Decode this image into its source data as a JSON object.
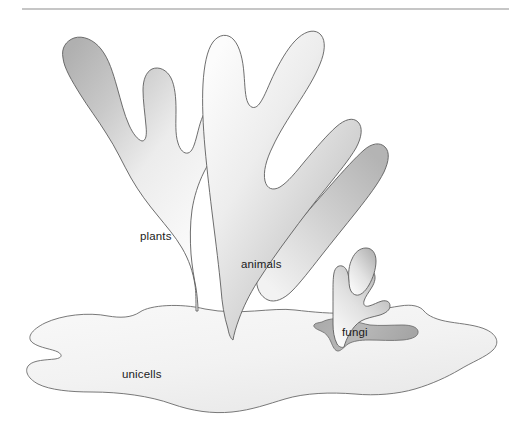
{
  "figure": {
    "background_color": "#ffffff",
    "width": 523,
    "height": 438,
    "rule": {
      "name": "top-horizontal-rule",
      "color": "#8d8d8d",
      "x1": 22,
      "x2": 509,
      "y": 9,
      "thickness": 1
    }
  },
  "palette": {
    "outline": "#5e5e5e",
    "fill_light": "#fafafa",
    "fill_mid": "#e0e0e0",
    "fill_dark": "#b2b2b2",
    "label_text": "#1b1b1b"
  },
  "labels": {
    "plants": "plants",
    "animals": "animals",
    "fungi": "fungi",
    "unicells": "unicells"
  },
  "groups": [
    {
      "id": "plants",
      "label": "plants",
      "label_x": 140,
      "label_y": 240,
      "branch_tips": 3,
      "shade": "dark-to-light"
    },
    {
      "id": "animals",
      "label": "animals",
      "label_x": 241,
      "label_y": 268,
      "branch_tips": 4,
      "shade": "light-to-dark"
    },
    {
      "id": "fungi",
      "label": "fungi",
      "label_x": 342,
      "label_y": 336,
      "branch_tips": 3,
      "shade": "light-to-dark"
    },
    {
      "id": "unicells",
      "label": "unicells",
      "label_x": 122,
      "label_y": 378,
      "branch_tips": 0,
      "shade": "light"
    }
  ]
}
